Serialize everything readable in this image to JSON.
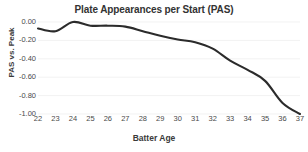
{
  "chart_data": {
    "type": "line",
    "title": "Plate Appearances per Start (PAS)",
    "xlabel": "Batter Age",
    "ylabel": "PAS vs. Peak",
    "x": [
      22,
      23,
      24,
      25,
      26,
      27,
      28,
      29,
      30,
      31,
      32,
      33,
      34,
      35,
      36,
      37
    ],
    "categories": [
      "22",
      "23",
      "24",
      "25",
      "26",
      "27",
      "28",
      "29",
      "30",
      "31",
      "32",
      "33",
      "34",
      "35",
      "36",
      "37"
    ],
    "values": [
      -0.07,
      -0.1,
      0.0,
      -0.04,
      -0.04,
      -0.05,
      -0.1,
      -0.15,
      -0.19,
      -0.22,
      -0.29,
      -0.42,
      -0.52,
      -0.64,
      -0.88,
      -1.0
    ],
    "series": [
      {
        "name": "PAS vs. Peak",
        "values": [
          -0.07,
          -0.1,
          0.0,
          -0.04,
          -0.04,
          -0.05,
          -0.1,
          -0.15,
          -0.19,
          -0.22,
          -0.29,
          -0.42,
          -0.52,
          -0.64,
          -0.88,
          -1.0
        ]
      }
    ],
    "xlim": [
      22,
      37
    ],
    "ylim": [
      -1.0,
      0.0
    ],
    "ytick_labels": [
      "0.00",
      "-0.20",
      "-0.40",
      "-0.60",
      "-0.80",
      "-1.00"
    ],
    "ytick_values": [
      0.0,
      -0.2,
      -0.4,
      -0.6,
      -0.8,
      -1.0
    ],
    "grid": true,
    "legend": "none",
    "line_color": "#2b2b2b",
    "grid_color": "#ededed",
    "background_color": "#ffffff",
    "text_color": "#3c3c3c"
  }
}
